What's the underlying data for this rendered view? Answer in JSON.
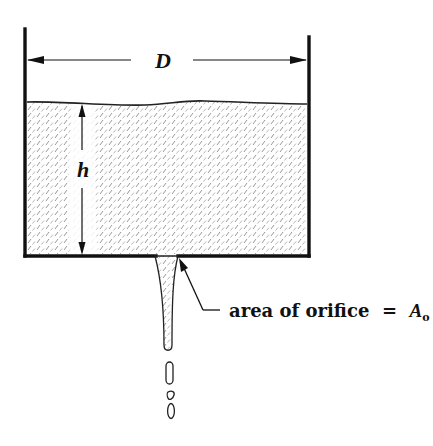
{
  "diagram": {
    "type": "tank-draining-through-orifice",
    "colors": {
      "stroke": "#111111",
      "liquid_hatch": "#9a9a9a",
      "background": "#ffffff"
    },
    "labels": {
      "diameter": "D",
      "height": "h",
      "orifice_text": "area of orifice  =  ",
      "orifice_symbol": "A",
      "orifice_subscript": "o"
    },
    "elements": {
      "tank": {
        "left_wall_x": 25,
        "right_wall_x": 309,
        "bottom_y": 256,
        "left_top_y": 28,
        "right_top_y": 36
      },
      "liquid_surface_y": 102,
      "diameter_arrow_y": 60,
      "height_arrow_x": 82,
      "orifice": {
        "left_x": 156,
        "right_x": 178
      },
      "jet_end_y": 352,
      "droplets": 3
    }
  }
}
